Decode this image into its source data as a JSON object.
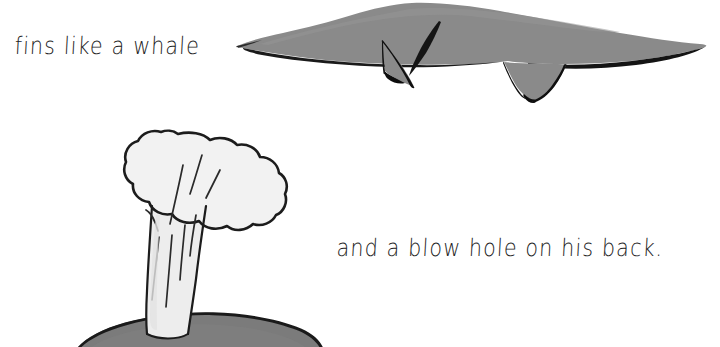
{
  "page": {
    "width": 720,
    "height": 347,
    "background_color": "#ffffff",
    "kind": "hand-drawn children's book illustration page"
  },
  "captions": {
    "fins": "fins like a whale",
    "blowhole": "and a blow hole on his back."
  },
  "illustrations": {
    "whale": {
      "label": "whale seen from the side with tail at left and two fins below",
      "body_fill": "#8a8a8a",
      "outline_color": "#121212"
    },
    "spout": {
      "label": "water spout blowing out of a blow hole",
      "cloud_fill": "#f2f2f2",
      "column_fill": "#ededed",
      "outline_color": "#1c1c1c",
      "streak_color": "#2a2a2a"
    },
    "whale_back": {
      "label": "rounded dark grey whale back breaking the surface",
      "fill": "#7b7b7b",
      "outline_color": "#1a1a1a",
      "blowhole_color": "#111111"
    }
  }
}
